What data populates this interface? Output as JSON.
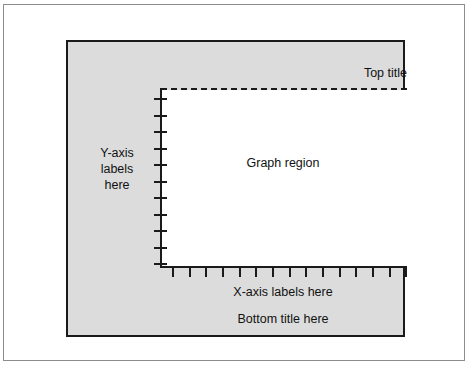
{
  "figure": {
    "top_title": "Top title",
    "graph_region_label": "Graph region",
    "y_axis_label_lines": [
      "Y-axis",
      "labels",
      "here"
    ],
    "x_axis_labels": "X-axis labels here",
    "bottom_title": "Bottom title here",
    "colors": {
      "plot_window_fill": "#dcdcdc",
      "graph_region_fill": "#ffffff",
      "ink": "#1a1a1a",
      "outer_frame": "#8d8d8d",
      "page_background": "#ffffff"
    }
  },
  "chart_data": {
    "type": "line",
    "title": "Top title",
    "subtitle": "Bottom title here",
    "xlabel": "X-axis labels here",
    "ylabel": "Y-axis labels here",
    "annotations": [
      "Top title",
      "Graph region",
      "Y-axis labels here",
      "X-axis labels here",
      "Bottom title here"
    ],
    "grid": false,
    "legend": null,
    "series": [],
    "x": [],
    "categories": [],
    "values": [],
    "x_tick_count": 15,
    "y_tick_count": 11,
    "x_tick_positions": [
      12,
      29,
      45,
      62,
      79,
      95,
      112,
      129,
      145,
      162,
      179,
      195,
      212,
      229,
      245
    ],
    "y_tick_positions": [
      10,
      27,
      43,
      60,
      76,
      93,
      109,
      126,
      142,
      159,
      175
    ],
    "top_border_style": "dashed",
    "axis_style": "solid"
  }
}
